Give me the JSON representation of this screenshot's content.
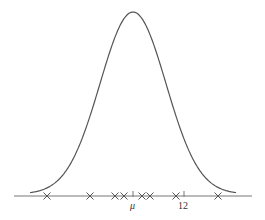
{
  "chart_data": {
    "type": "line",
    "title": "",
    "xlabel": "",
    "ylabel": "",
    "grid": false,
    "legend": null,
    "curve": {
      "name": "normal density",
      "peak_x_label": "μ"
    },
    "axis_ticks": [
      {
        "label": "μ",
        "px": 133
      },
      {
        "label": "12",
        "px": 184
      }
    ],
    "sample_points_px": [
      47,
      90,
      115,
      124,
      142,
      150,
      176,
      218
    ],
    "sample_marker": "×",
    "colors": {
      "curve": "#555555",
      "axis": "#777777",
      "markers": "#555555"
    }
  },
  "labels": {
    "mu": "μ",
    "twelve": "12"
  }
}
